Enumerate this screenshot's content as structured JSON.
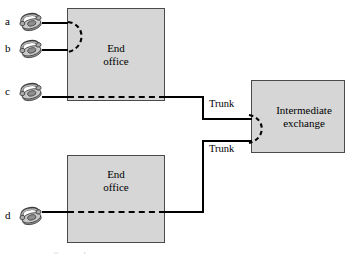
{
  "diagram": {
    "type": "network-topology",
    "background_color": "#ffffff",
    "line_color": "#000000",
    "box_fill_color": "#d6d6d6",
    "box_border_color": "#4a4a4a"
  },
  "nodes": {
    "end_office_top": {
      "label_line1": "End",
      "label_line2": "office",
      "x": 67,
      "y": 8,
      "width": 98,
      "height": 93
    },
    "end_office_bottom": {
      "label_line1": "End",
      "label_line2": "office",
      "x": 67,
      "y": 155,
      "width": 98,
      "height": 88
    },
    "intermediate_exchange": {
      "label_line1": "Intermediate",
      "label_line2": "exchange",
      "x": 251,
      "y": 80,
      "width": 94,
      "height": 73
    }
  },
  "subscribers": [
    {
      "id": "a",
      "label": "a",
      "icon": "telephone-icon",
      "office": "end_office_top",
      "y": 22
    },
    {
      "id": "b",
      "label": "b",
      "icon": "telephone-icon",
      "office": "end_office_top",
      "y": 49
    },
    {
      "id": "c",
      "label": "c",
      "icon": "telephone-icon",
      "office": "end_office_top",
      "y": 92
    },
    {
      "id": "d",
      "label": "d",
      "icon": "telephone-icon",
      "office": "end_office_bottom",
      "y": 216
    }
  ],
  "links": {
    "trunk_upper_label": "Trunk",
    "trunk_lower_label": "Trunk",
    "local_call_path": "a-to-b switched inside top end office (dashed arc)",
    "transit_path": "c-to-d routed via two trunks through intermediate exchange (dashed arc)"
  },
  "caption": {
    "text": "Figure  Telephone network with end offices and trunks"
  }
}
